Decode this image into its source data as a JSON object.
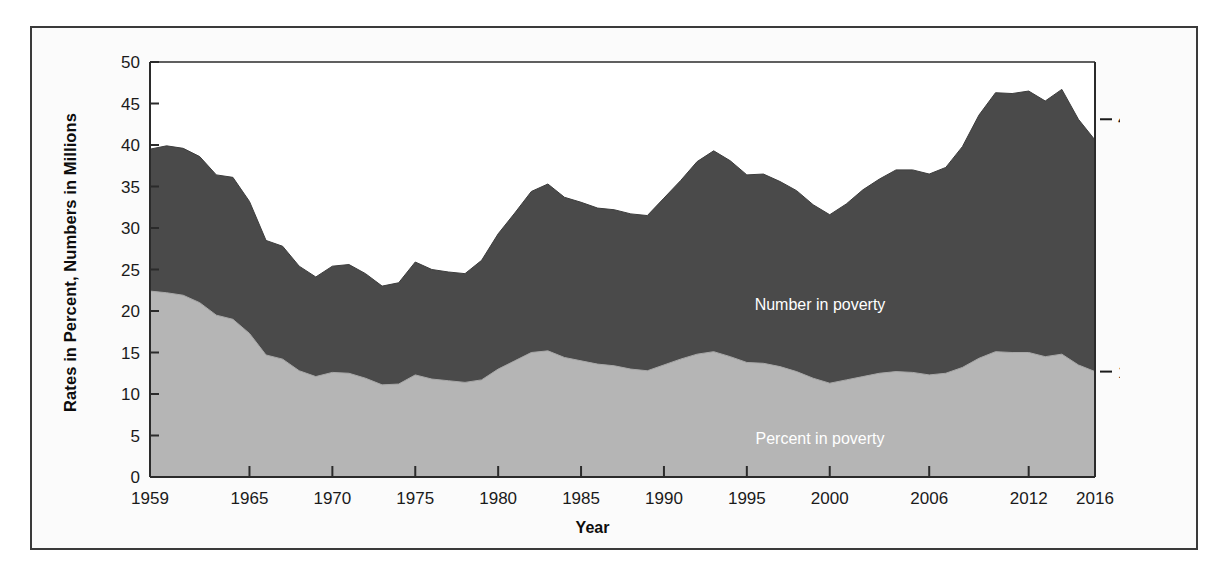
{
  "chart_data": {
    "type": "area",
    "title": "",
    "xlabel": "Year",
    "ylabel": "Rates in Percent, Numbers in Millions",
    "xlim": [
      1959,
      2016
    ],
    "ylim": [
      0,
      50
    ],
    "grid": false,
    "legend_position": "inline-labels",
    "x_tick_labels": [
      "1959",
      "1965",
      "1970",
      "1975",
      "1980",
      "1985",
      "1990",
      "1995",
      "2000",
      "2006",
      "2012",
      "2016"
    ],
    "x_tick_values": [
      1959,
      1965,
      1970,
      1975,
      1980,
      1985,
      1990,
      1995,
      2000,
      2006,
      2012,
      2016
    ],
    "y_tick_labels": [
      "0",
      "5",
      "10",
      "15",
      "20",
      "25",
      "30",
      "35",
      "40",
      "45",
      "50"
    ],
    "y_tick_values": [
      0,
      5,
      10,
      15,
      20,
      25,
      30,
      35,
      40,
      45,
      50
    ],
    "x": [
      1959,
      1960,
      1961,
      1962,
      1963,
      1964,
      1965,
      1966,
      1967,
      1968,
      1969,
      1970,
      1971,
      1972,
      1973,
      1974,
      1975,
      1976,
      1977,
      1978,
      1979,
      1980,
      1981,
      1982,
      1983,
      1984,
      1985,
      1986,
      1987,
      1988,
      1989,
      1990,
      1991,
      1992,
      1993,
      1994,
      1995,
      1996,
      1997,
      1998,
      1999,
      2000,
      2001,
      2002,
      2003,
      2004,
      2005,
      2006,
      2007,
      2008,
      2009,
      2010,
      2011,
      2012,
      2013,
      2014,
      2015,
      2016
    ],
    "series": [
      {
        "name": "Number in poverty",
        "units": "millions",
        "color": "#4a4a4a",
        "label_text": "Number in poverty",
        "end_callout": "43.1 million",
        "values": [
          39.5,
          39.9,
          39.6,
          38.6,
          36.4,
          36.1,
          33.2,
          28.5,
          27.8,
          25.4,
          24.1,
          25.4,
          25.6,
          24.5,
          23.0,
          23.4,
          25.9,
          25.0,
          24.7,
          24.5,
          26.1,
          29.3,
          31.8,
          34.4,
          35.3,
          33.7,
          33.1,
          32.4,
          32.2,
          31.7,
          31.5,
          33.6,
          35.7,
          38.0,
          39.3,
          38.1,
          36.4,
          36.5,
          35.6,
          34.5,
          32.8,
          31.6,
          32.9,
          34.6,
          35.9,
          37.0,
          37.0,
          36.5,
          37.3,
          39.8,
          43.6,
          46.3,
          46.2,
          46.5,
          45.3,
          46.7,
          43.1,
          40.6
        ]
      },
      {
        "name": "Percent in poverty",
        "units": "percent",
        "color": "#b5b5b5",
        "label_text": "Percent in poverty",
        "end_callout": "12.7%",
        "values": [
          22.4,
          22.2,
          21.9,
          21.0,
          19.5,
          19.0,
          17.3,
          14.7,
          14.2,
          12.8,
          12.1,
          12.6,
          12.5,
          11.9,
          11.1,
          11.2,
          12.3,
          11.8,
          11.6,
          11.4,
          11.7,
          13.0,
          14.0,
          15.0,
          15.2,
          14.4,
          14.0,
          13.6,
          13.4,
          13.0,
          12.8,
          13.5,
          14.2,
          14.8,
          15.1,
          14.5,
          13.8,
          13.7,
          13.3,
          12.7,
          11.9,
          11.3,
          11.7,
          12.1,
          12.5,
          12.7,
          12.6,
          12.3,
          12.5,
          13.2,
          14.3,
          15.1,
          15.0,
          15.0,
          14.5,
          14.8,
          13.5,
          12.7
        ]
      }
    ],
    "annotations": [
      {
        "name": "number-callout",
        "text": "43.1 million",
        "at_year": 2016,
        "at_value": 43.1
      },
      {
        "name": "percent-callout",
        "text": "12.7%",
        "at_year": 2016,
        "at_value": 12.7
      }
    ]
  },
  "axis": {
    "y_title": "Rates in Percent, Numbers in Millions",
    "x_title": "Year"
  },
  "colors": {
    "number_band": "#4a4a4a",
    "percent_band": "#b5b5b5",
    "axis": "#2b2b2b",
    "frame": "#3a3a3a",
    "page_background": "#ffffff",
    "panel_background": "#fbfbfb"
  }
}
